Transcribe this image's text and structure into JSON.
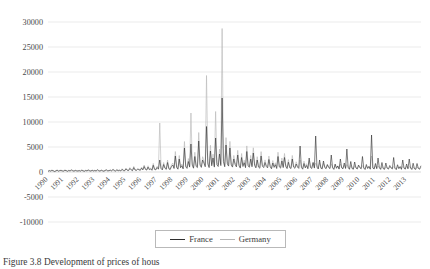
{
  "figure": {
    "caption": "Figure 3.8  Development of prices of hous"
  },
  "legend": {
    "position": "bottom-center",
    "entries": [
      {
        "label": "France",
        "color": "#2f2f2f"
      },
      {
        "label": "Germany",
        "color": "#b6b6b6"
      }
    ]
  },
  "chart_data": {
    "type": "line",
    "title": "",
    "xlabel": "",
    "ylabel": "",
    "grid": true,
    "ylim": [
      -10000,
      30000
    ],
    "yticks": [
      30000,
      25000,
      20000,
      15000,
      10000,
      5000,
      0,
      -5000,
      -10000
    ],
    "ytick_labels": [
      "30000",
      "25000",
      "20000",
      "15000",
      "10000",
      "5000",
      "0",
      "-5000",
      "-10000"
    ],
    "xlim": [
      1990,
      2013.92
    ],
    "xticks": [
      1990,
      1991,
      1992,
      1993,
      1994,
      1995,
      1996,
      1997,
      1998,
      1999,
      2000,
      2001,
      2002,
      2003,
      2004,
      2005,
      2006,
      2007,
      2008,
      2009,
      2010,
      2011,
      2012,
      2013
    ],
    "xtick_labels": [
      "1990",
      "1991",
      "1992",
      "1993",
      "1994",
      "1995",
      "1996",
      "1997",
      "1998",
      "1999",
      "2000",
      "2001",
      "2002",
      "2003",
      "2004",
      "2005",
      "2006",
      "2007",
      "2008",
      "2009",
      "2010",
      "2011",
      "2012",
      "2013"
    ],
    "x_start": 1990.0,
    "x_step": 0.08333,
    "series": [
      {
        "name": "France",
        "color": "#2f2f2f",
        "values": [
          120,
          260,
          180,
          310,
          240,
          90,
          200,
          350,
          170,
          260,
          300,
          210,
          180,
          330,
          260,
          140,
          290,
          200,
          380,
          250,
          160,
          300,
          220,
          190,
          260,
          180,
          340,
          220,
          150,
          290,
          210,
          370,
          240,
          180,
          320,
          200,
          280,
          190,
          410,
          250,
          170,
          330,
          230,
          150,
          300,
          390,
          210,
          260,
          340,
          220,
          480,
          290,
          180,
          420,
          250,
          330,
          200,
          520,
          280,
          240,
          620,
          350,
          280,
          700,
          420,
          260,
          880,
          390,
          310,
          540,
          450,
          330,
          760,
          420,
          1100,
          520,
          380,
          980,
          460,
          620,
          340,
          1350,
          520,
          430,
          900,
          560,
          2400,
          680,
          420,
          1500,
          760,
          520,
          1900,
          640,
          480,
          1100,
          1400,
          700,
          3200,
          920,
          560,
          2600,
          840,
          1250,
          620,
          4800,
          1050,
          720,
          2100,
          980,
          5600,
          1380,
          760,
          3100,
          1120,
          880,
          6200,
          1400,
          920,
          2400,
          1800,
          1050,
          9100,
          1600,
          880,
          4200,
          1250,
          2800,
          980,
          6800,
          1450,
          1100,
          3600,
          1280,
          14800,
          2100,
          1050,
          5400,
          1600,
          1180,
          4800,
          1380,
          980,
          2600,
          1500,
          1020,
          3400,
          1250,
          780,
          2900,
          1100,
          1850,
          860,
          4100,
          1200,
          940,
          2600,
          1050,
          3800,
          1320,
          820,
          2400,
          980,
          760,
          3200,
          1150,
          880,
          1900,
          1100,
          820,
          2500,
          1050,
          640,
          1800,
          920,
          1450,
          700,
          3100,
          1020,
          780,
          2200,
          880,
          2900,
          1100,
          680,
          1950,
          860,
          700,
          2600,
          980,
          740,
          1600,
          980,
          720,
          5200,
          920,
          560,
          1700,
          820,
          1300,
          640,
          2800,
          900,
          700,
          1900,
          780,
          7200,
          980,
          600,
          2400,
          760,
          620,
          2200,
          880,
          660,
          1500,
          900,
          680,
          3400,
          840,
          520,
          1600,
          740,
          1200,
          580,
          2600,
          820,
          640,
          1800,
          700,
          4600,
          900,
          540,
          2100,
          700,
          560,
          2000,
          800,
          600,
          1400,
          860,
          640,
          3100,
          780,
          500,
          1500,
          700,
          1150,
          560,
          7400,
          780,
          600,
          1700,
          660,
          2800,
          840,
          520,
          1900,
          660,
          540,
          1800,
          760,
          580,
          1300,
          820,
          620,
          2900,
          740,
          480,
          1450,
          680,
          1100,
          540,
          2400,
          740,
          580,
          1600,
          640,
          2600,
          800,
          500,
          1750,
          640,
          520,
          1700,
          720,
          560,
          1250
        ]
      },
      {
        "name": "Germany",
        "color": "#b6b6b6",
        "values": [
          180,
          320,
          240,
          400,
          300,
          150,
          260,
          430,
          220,
          330,
          380,
          270,
          230,
          420,
          330,
          190,
          360,
          260,
          470,
          320,
          210,
          380,
          290,
          240,
          330,
          230,
          430,
          280,
          200,
          370,
          270,
          470,
          310,
          230,
          410,
          260,
          360,
          240,
          520,
          320,
          220,
          420,
          300,
          200,
          380,
          490,
          270,
          330,
          430,
          280,
          610,
          370,
          230,
          530,
          320,
          420,
          260,
          660,
          360,
          310,
          790,
          450,
          360,
          890,
          540,
          330,
          1120,
          500,
          400,
          690,
          580,
          420,
          970,
          540,
          1400,
          660,
          490,
          1250,
          590,
          790,
          440,
          1720,
          660,
          550,
          1150,
          710,
          9800,
          870,
          540,
          1900,
          970,
          660,
          2400,
          820,
          610,
          1400,
          1800,
          890,
          4100,
          1170,
          710,
          3300,
          1070,
          1590,
          790,
          6100,
          1340,
          920,
          2700,
          1250,
          11800,
          1760,
          970,
          3950,
          1430,
          1120,
          7900,
          1780,
          1170,
          3060,
          2300,
          1340,
          19300,
          2040,
          1120,
          5350,
          1590,
          3570,
          1250,
          12100,
          1850,
          1400,
          4590,
          1630,
          28700,
          2680,
          1340,
          6880,
          2040,
          1500,
          6120,
          1760,
          1250,
          3310,
          1910,
          1300,
          4330,
          1590,
          990,
          3700,
          1400,
          2360,
          1100,
          5220,
          1530,
          1200,
          3310,
          1340,
          4840,
          1680,
          1040,
          3060,
          1250,
          970,
          4080,
          1470,
          1120,
          2420,
          1400,
          1040,
          3190,
          1340,
          820,
          2290,
          1170,
          1850,
          890,
          3950,
          1300,
          990,
          2800,
          1120,
          3700,
          1400,
          870,
          2480,
          1100,
          890,
          3310,
          1250,
          940,
          2040,
          1250,
          920,
          2400,
          1170,
          710,
          2170,
          1040,
          1660,
          820,
          2290,
          1150,
          890,
          1910,
          990,
          1780,
          1250,
          760,
          1850,
          970,
          790,
          1720,
          1120,
          840,
          1400,
          1040,
          790,
          1630,
          970,
          610,
          1400,
          860,
          1250,
          660,
          1590,
          950,
          740,
          1340,
          810,
          1500,
          1040,
          630,
          1300,
          810,
          650,
          1250,
          930,
          700,
          1120,
          990,
          740,
          1280,
          900,
          580,
          1150,
          810,
          970,
          650,
          3200,
          900,
          690,
          1250,
          760,
          1180,
          970,
          600,
          1100,
          760,
          620,
          1040,
          880,
          670,
          950,
          940,
          710,
          1090,
          850,
          550,
          1020,
          780,
          880,
          620,
          1120,
          850,
          660,
          1150,
          740,
          1060,
          900,
          580,
          1000,
          740,
          600,
          970,
          820,
          630,
          900
        ]
      }
    ]
  }
}
